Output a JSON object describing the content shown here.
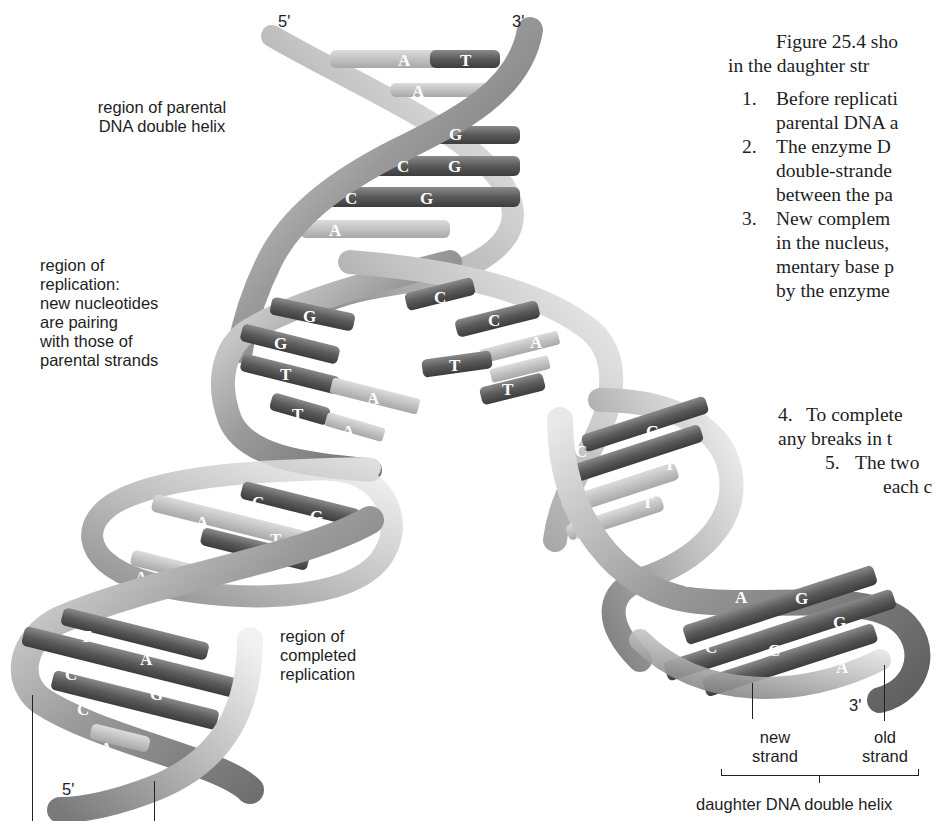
{
  "figure": {
    "strand_ends": {
      "top_left": "5'",
      "top_right": "3'",
      "bottom_left": "5'",
      "bottom_right": "3'"
    },
    "labels": {
      "parental": "region of parental\nDNA double helix",
      "replication": "region of\nreplication:\nnew nucleotides\nare pairing\nwith those of\nparental strands",
      "completed": "region of\ncompleted\nreplication",
      "new_strand": "new\nstrand",
      "old_strand": "old\nstrand",
      "daughter": "daughter DNA double helix"
    },
    "bases": {
      "parental": [
        "A",
        "T",
        "A",
        "G",
        "C",
        "G",
        "C",
        "G",
        "A"
      ],
      "fork_left": [
        "G",
        "G",
        "T",
        "A",
        "T",
        "A"
      ],
      "fork_right": [
        "C",
        "C",
        "A",
        "T",
        "A",
        "T"
      ],
      "left_daughter": [
        "C",
        "G",
        "A",
        "T",
        "A",
        "A",
        "T",
        "A",
        "C",
        "G",
        "C",
        "G",
        "A"
      ],
      "right_daughter": [
        "C",
        "G",
        "T",
        "A",
        "T",
        "A",
        "A",
        "G",
        "A",
        "T",
        "G",
        "C",
        "C",
        "G",
        "A"
      ]
    }
  },
  "text": {
    "intro_line1": "Figure 25.4 sho",
    "intro_line2": "in the daughter str",
    "items": [
      {
        "num": "1.",
        "lines": [
          "Before replicati",
          "parental DNA a"
        ]
      },
      {
        "num": "2.",
        "lines": [
          "The enzyme D",
          "double-strande",
          "between the pa"
        ]
      },
      {
        "num": "3.",
        "lines": [
          "New complem",
          "in the nucleus,",
          "mentary base p",
          "by the enzyme"
        ]
      },
      {
        "num": "4.",
        "lines": [
          "To complete",
          "any breaks in t"
        ]
      },
      {
        "num": "5.",
        "lines": [
          "The two",
          "each c"
        ]
      }
    ]
  }
}
